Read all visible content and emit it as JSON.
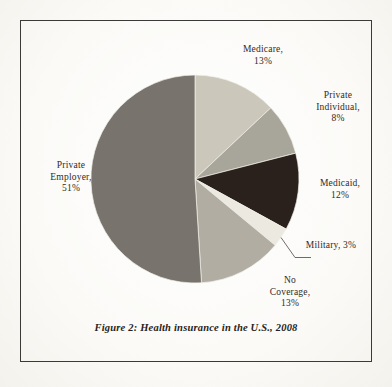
{
  "figure": {
    "caption": "Figure 2: Health insurance in the U.S., 2008",
    "background_color": "#fcfcfa",
    "frame_color": "#3a3a38"
  },
  "chart_data": {
    "type": "pie",
    "title": "Health insurance in the U.S., 2008",
    "subtitle": "",
    "xlabel": "",
    "ylabel": "",
    "legend_position": "none",
    "labels_position": "outside",
    "start_angle_deg": 0,
    "direction": "clockwise",
    "grid": false,
    "categories": [
      "Medicare",
      "Private Individual",
      "Medicaid",
      "Military",
      "No Coverage",
      "Private Employer"
    ],
    "values": [
      13,
      8,
      12,
      3,
      13,
      51
    ],
    "unit": "%",
    "colors": [
      "#cbc7bb",
      "#a8a59b",
      "#2b211c",
      "#ece9e0",
      "#b1ada3",
      "#78746d"
    ],
    "slices": [
      {
        "name": "Medicare",
        "value": 13,
        "label": "Medicare,\n13%",
        "color": "#cbc7bb",
        "label_x": 218,
        "label_y": 44,
        "label_width": 90,
        "leader_line": false
      },
      {
        "name": "Private Individual",
        "value": 8,
        "label": "Private\nIndividual,\n8%",
        "color": "#a8a59b",
        "label_x": 294,
        "label_y": 90,
        "label_width": 88,
        "leader_line": false
      },
      {
        "name": "Medicaid",
        "value": 12,
        "label": "Medicaid,\n12%",
        "color": "#2b211c",
        "label_x": 300,
        "label_y": 178,
        "label_width": 80,
        "leader_line": false
      },
      {
        "name": "Military",
        "value": 3,
        "label": "Military, 3%",
        "color": "#ece9e0",
        "label_x": 292,
        "label_y": 240,
        "label_width": 78,
        "leader_line": true
      },
      {
        "name": "No Coverage",
        "value": 13,
        "label": "No\nCoverage,\n13%",
        "color": "#b1ada3",
        "label_x": 248,
        "label_y": 275,
        "label_width": 84,
        "leader_line": false
      },
      {
        "name": "Private Employer",
        "value": 51,
        "label": "Private\nEmployer,\n51%",
        "color": "#78746d",
        "label_x": 26,
        "label_y": 160,
        "label_width": 90,
        "leader_line": false
      }
    ],
    "geometry": {
      "center_x": 195,
      "center_y": 179,
      "radius": 104
    }
  }
}
